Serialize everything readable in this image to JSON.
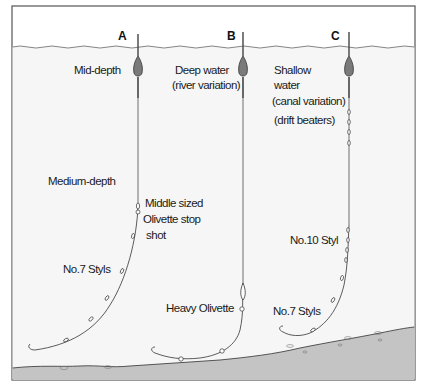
{
  "diagram": {
    "type": "float-fishing rig comparison",
    "colors": {
      "background": "#ffffff",
      "water": "#f6f6f6",
      "frame": "#555555",
      "line": "#333333",
      "float_body": "#7a7a7a",
      "seabed": "#c4c4c4"
    },
    "rigs": [
      {
        "id": "A",
        "letter": "A",
        "labels": {
          "depth": "Mid-depth",
          "depth2": "Medium-depth",
          "stop_shot_line1": "Middle sized",
          "stop_shot_line2": "Olivette stop",
          "stop_shot_line3": "shot",
          "styls": "No.7 Styls"
        }
      },
      {
        "id": "B",
        "letter": "B",
        "labels": {
          "depth_line1": "Deep water",
          "depth_line2": "(river variation)",
          "olivette": "Heavy Olivette"
        }
      },
      {
        "id": "C",
        "letter": "C",
        "labels": {
          "depth_line1": "Shallow",
          "depth_line2": "water",
          "variation": "(canal variation)",
          "drift": "(drift beaters)",
          "styl10": "No.10 Styl",
          "styls7": "No.7 Styls"
        }
      }
    ]
  }
}
